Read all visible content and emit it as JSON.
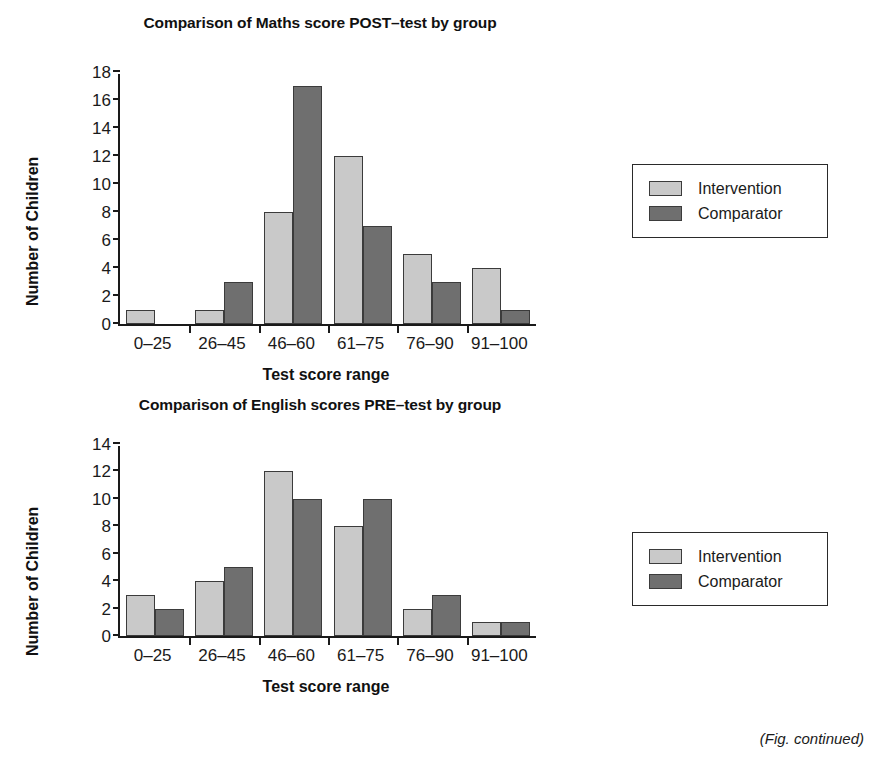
{
  "figure": {
    "note": "(Fig. continued)",
    "colors": {
      "intervention": "#c9c9c9",
      "comparator": "#6f6f6f",
      "axis": "#1a1a1a"
    }
  },
  "chart_data": [
    {
      "type": "bar",
      "title": "Comparison of Maths score POST–test by group",
      "xlabel": "Test score range",
      "ylabel": "Number of Children",
      "categories": [
        "0–25",
        "26–45",
        "46–60",
        "61–75",
        "76–90",
        "91–100"
      ],
      "series": [
        {
          "name": "Intervention",
          "color": "#c9c9c9",
          "values": [
            1,
            1,
            8,
            12,
            5,
            4
          ]
        },
        {
          "name": "Comparator",
          "color": "#6f6f6f",
          "values": [
            0,
            3,
            17,
            7,
            3,
            1
          ]
        }
      ],
      "ylim": [
        0,
        18
      ],
      "yticks": [
        0,
        2,
        4,
        6,
        8,
        10,
        12,
        14,
        16,
        18
      ],
      "grid": false,
      "legend": {
        "position": "right",
        "entries": [
          "Intervention",
          "Comparator"
        ]
      }
    },
    {
      "type": "bar",
      "title": "Comparison of English scores PRE–test by group",
      "xlabel": "Test score range",
      "ylabel": "Number of Children",
      "categories": [
        "0–25",
        "26–45",
        "46–60",
        "61–75",
        "76–90",
        "91–100"
      ],
      "series": [
        {
          "name": "Intervention",
          "color": "#c9c9c9",
          "values": [
            3,
            4,
            12,
            8,
            2,
            1
          ]
        },
        {
          "name": "Comparator",
          "color": "#6f6f6f",
          "values": [
            2,
            5,
            10,
            10,
            3,
            1
          ]
        }
      ],
      "ylim": [
        0,
        14
      ],
      "yticks": [
        0,
        2,
        4,
        6,
        8,
        10,
        12,
        14
      ],
      "grid": false,
      "legend": {
        "position": "right",
        "entries": [
          "Intervention",
          "Comparator"
        ]
      }
    }
  ]
}
